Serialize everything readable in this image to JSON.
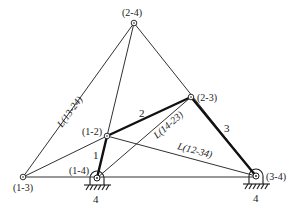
{
  "diagram": {
    "type": "four-bar linkage instant centers (Kennedy theorem) diagram",
    "colors": {
      "line": "#1a1a1a",
      "background": "#ffffff"
    },
    "poles": [
      {
        "id": "p13",
        "label": "(1-3)",
        "x": 23,
        "y": 177
      },
      {
        "id": "p14",
        "label": "(1-4)",
        "x": 97,
        "y": 178
      },
      {
        "id": "p12",
        "label": "(1-2)",
        "x": 107,
        "y": 136
      },
      {
        "id": "p23",
        "label": "(2-3)",
        "x": 191,
        "y": 97
      },
      {
        "id": "p24",
        "label": "(2-4)",
        "x": 134,
        "y": 23
      },
      {
        "id": "p34",
        "label": "(3-4)",
        "x": 256,
        "y": 176
      }
    ],
    "links": [
      {
        "id": "link1",
        "label": "1",
        "from": "(1-4)",
        "to": "(1-2)"
      },
      {
        "id": "link2",
        "label": "2",
        "from": "(1-2)",
        "to": "(2-3)"
      },
      {
        "id": "link3",
        "label": "3",
        "from": "(2-3)",
        "to": "(3-4)"
      },
      {
        "id": "link4",
        "label": "4",
        "note": "ground / frame"
      }
    ],
    "lines": [
      {
        "id": "L13-24",
        "label": "L(13-24)"
      },
      {
        "id": "L14-23",
        "label": "L(14-23)"
      },
      {
        "id": "L12-34",
        "label": "L(12-34)"
      }
    ],
    "ground_labels": [
      "4",
      "4"
    ]
  }
}
